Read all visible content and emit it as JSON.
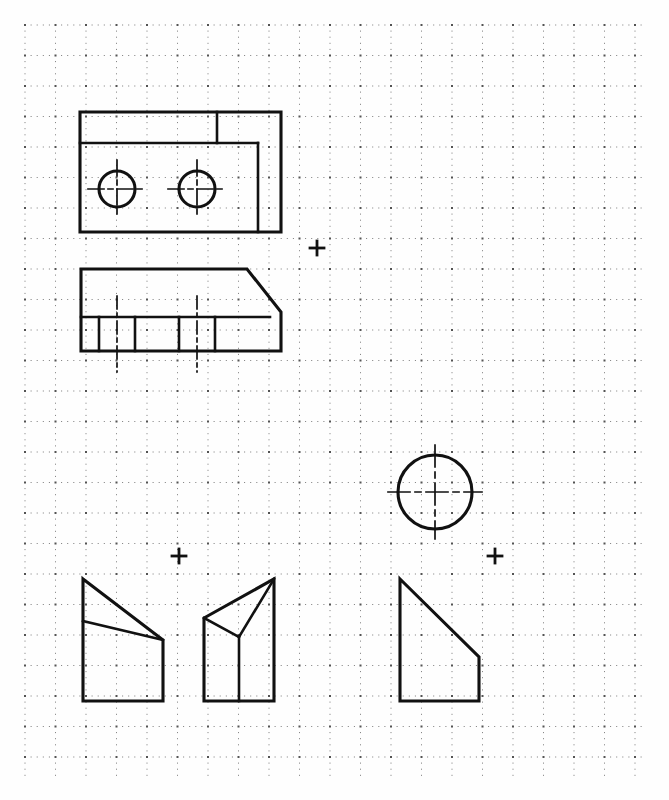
{
  "sheet": {
    "title": "Orthographic engineering sketch on dotted grid paper",
    "width": 669,
    "height": 800,
    "background_color": "#fefefe",
    "ink_color": "#111111",
    "grid_dot_color": "#4a4a4a"
  },
  "grid": {
    "name": "dotted-engineering-grid",
    "origin_x": 25,
    "origin_y": 25,
    "extent_x": 647,
    "extent_y": 777,
    "minor_spacing": 6.1,
    "major_spacing": 30.5,
    "minor_dot_size": 1,
    "major_dot_size": 2,
    "grid_on": true
  },
  "registration_marks": [
    {
      "label": "plus-mark-upper-right",
      "x": 317,
      "y": 248,
      "arm": 7
    },
    {
      "label": "plus-mark-lower-left",
      "x": 179,
      "y": 556,
      "arm": 7
    },
    {
      "label": "plus-mark-lower-right",
      "x": 495,
      "y": 556,
      "arm": 7
    }
  ],
  "views": [
    {
      "id": "top-view",
      "label": "Top view — stepped plate with two through holes",
      "outline": "80,112 281,112 281,232 80,232",
      "internal_lines": [
        {
          "name": "step-vertical-upper",
          "x1": 217,
          "y1": 112,
          "x2": 217,
          "y2": 143
        },
        {
          "name": "step-horizontal",
          "x1": 80,
          "y1": 143,
          "x2": 258,
          "y2": 143
        },
        {
          "name": "step-vertical-lower",
          "x1": 258,
          "y1": 143,
          "x2": 258,
          "y2": 232
        }
      ],
      "holes": [
        {
          "name": "hole-left",
          "cx": 117,
          "cy": 189,
          "r": 18,
          "centerline_h": {
            "x1": 88,
            "x2": 146
          },
          "centerline_v": {
            "y1": 160,
            "y2": 218
          }
        },
        {
          "name": "hole-right",
          "cx": 197,
          "cy": 189,
          "r": 18,
          "centerline_h": {
            "x1": 168,
            "x2": 226
          },
          "centerline_v": {
            "y1": 160,
            "y2": 218
          }
        }
      ]
    },
    {
      "id": "front-view",
      "label": "Front view — chamfered block with counterbored holes",
      "outline": "81,269 247,269 281,317 281,334 281,351 81,351",
      "outline_points": "81,269 247,269 281,312 281,351 81,351",
      "internal_lines": [
        {
          "name": "ledge-horizontal",
          "x1": 81,
          "y1": 317,
          "x2": 270,
          "y2": 317
        },
        {
          "name": "hole-left-edge-a",
          "x1": 99,
          "y1": 317,
          "x2": 99,
          "y2": 351,
          "style": "solid"
        },
        {
          "name": "hole-left-center",
          "x1": 117,
          "y1": 296,
          "x2": 117,
          "y2": 372,
          "style": "dashed-center"
        },
        {
          "name": "hole-left-edge-b",
          "x1": 135,
          "y1": 317,
          "x2": 135,
          "y2": 351,
          "style": "solid"
        },
        {
          "name": "hole-right-edge-a",
          "x1": 179,
          "y1": 317,
          "x2": 179,
          "y2": 351,
          "style": "solid"
        },
        {
          "name": "hole-right-center",
          "x1": 197,
          "y1": 296,
          "x2": 197,
          "y2": 372,
          "style": "dashed-center"
        },
        {
          "name": "hole-right-edge-b",
          "x1": 215,
          "y1": 317,
          "x2": 215,
          "y2": 351,
          "style": "solid"
        }
      ]
    },
    {
      "id": "circle-view",
      "label": "Circular boss view with crossed centerlines",
      "cx": 435,
      "cy": 492,
      "r": 37,
      "centerline_h": {
        "x1": 388,
        "x2": 482
      },
      "centerline_v": {
        "y1": 445,
        "y2": 539
      }
    },
    {
      "id": "pictorial-left",
      "label": "Pictorial A — wedge block, sloped top face",
      "outline": "83,579 163,640 163,701 83,701",
      "internal_lines": [
        {
          "name": "slope-fold-line",
          "x1": 83,
          "y1": 621,
          "x2": 163,
          "y2": 640
        }
      ]
    },
    {
      "id": "pictorial-middle",
      "label": "Pictorial B — block with triangular pocket",
      "outline": "204,618 274,579 274,701 204,701",
      "internal_lines": [
        {
          "name": "pocket-edge-left",
          "x1": 204,
          "y1": 618,
          "x2": 239,
          "y2": 637
        },
        {
          "name": "pocket-edge-right",
          "x1": 239,
          "y1": 637,
          "x2": 274,
          "y2": 579
        },
        {
          "name": "pocket-vertical",
          "x1": 239,
          "y1": 637,
          "x2": 239,
          "y2": 701
        }
      ]
    },
    {
      "id": "pictorial-right",
      "label": "Pictorial C — right triangular prism with flat base",
      "outline": "400,579 479,657 479,701 400,701",
      "internal_lines": []
    }
  ]
}
